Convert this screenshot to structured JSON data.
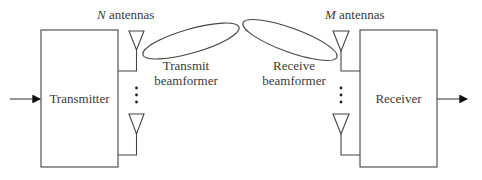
{
  "diagram": {
    "transmitter": {
      "label": "Transmitter"
    },
    "receiver": {
      "label": "Receiver"
    },
    "tx_antennas": {
      "count_symbol": "N",
      "suffix": " antennas"
    },
    "rx_antennas": {
      "count_symbol": "M",
      "suffix": " antennas"
    },
    "tx_beamformer": {
      "line1": "Transmit",
      "line2": "beamformer"
    },
    "rx_beamformer": {
      "line1": "Receive",
      "line2": "beamformer"
    },
    "ellipsis": "⋮"
  }
}
